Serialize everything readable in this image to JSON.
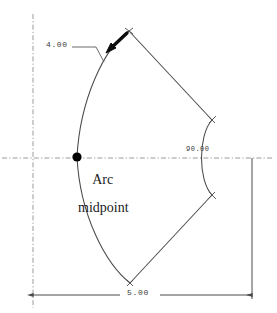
{
  "drawing": {
    "title": "Arc midpoint construction sketch",
    "background_color": "#ffffff",
    "line_color": "#4a4a4a",
    "text_color": "#1a1a1a",
    "centerline_color": "#8a8a8a",
    "marker_color": "#000000"
  },
  "annotations": {
    "arc_midpoint_line1": "Arc",
    "arc_midpoint_line2": "midpoint",
    "radius_dimension": "4.00",
    "angle_dimension": "90.00",
    "length_dimension": "5.00"
  },
  "geometry": {
    "origin": {
      "x": 33,
      "y": 158
    },
    "arc_midpoint_marker": {
      "x": 77,
      "y": 157,
      "radius": 4.5
    },
    "top_vertex": {
      "x": 129,
      "y": 31
    },
    "bottom_vertex": {
      "x": 130,
      "y": 283
    },
    "right_arc_top_end": {
      "x": 212,
      "y": 120
    },
    "right_arc_bottom_end": {
      "x": 212,
      "y": 195
    },
    "left_arc_leader_touch": {
      "x": 104,
      "y": 62
    },
    "dimension_line_y": 295,
    "dimension_line_x1": 33,
    "dimension_line_x2": 252
  }
}
